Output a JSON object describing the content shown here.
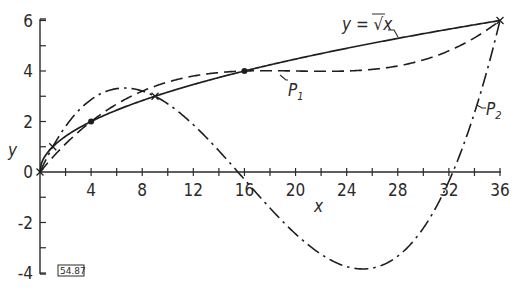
{
  "chart_data": {
    "type": "line",
    "title": "",
    "xlabel": "x",
    "ylabel": "y",
    "xlim": [
      0,
      36
    ],
    "ylim": [
      -4,
      6
    ],
    "grid": false,
    "legend_position": "inline labels on curves",
    "x_ticks": [
      0,
      2,
      4,
      6,
      8,
      10,
      12,
      14,
      16,
      18,
      20,
      22,
      24,
      26,
      28,
      30,
      32,
      34,
      36
    ],
    "x_tick_labels": [
      "4",
      "8",
      "12",
      "16",
      "20",
      "24",
      "28",
      "32",
      "36"
    ],
    "x_tick_label_values": [
      4,
      8,
      12,
      16,
      20,
      24,
      28,
      32,
      36
    ],
    "y_ticks": [
      -4,
      -3,
      -2,
      -1,
      0,
      1,
      2,
      3,
      4,
      5,
      6
    ],
    "y_tick_labels": [
      "-4",
      "-2",
      "0",
      "2",
      "4",
      "6"
    ],
    "y_tick_label_values": [
      -4,
      -2,
      0,
      2,
      4,
      6
    ],
    "series": [
      {
        "name": "y = ∛x",
        "label": "y = √x",
        "style": "solid",
        "function": "sqrt(x)",
        "x": [
          0,
          0.25,
          1,
          2,
          4,
          6,
          9,
          12,
          16,
          20,
          25,
          30,
          36
        ],
        "values": [
          0,
          0.5,
          1,
          1.41,
          2,
          2.45,
          3,
          3.46,
          4,
          4.47,
          5,
          5.48,
          6
        ]
      },
      {
        "name": "P1",
        "label": "P1",
        "style": "dashed",
        "interpolation_nodes_x": [
          0,
          4,
          16,
          36
        ],
        "interpolation_nodes_y": [
          0,
          2,
          4,
          6
        ],
        "x": [
          0,
          2,
          4,
          6,
          8,
          10,
          12,
          14,
          16,
          18,
          20,
          22,
          24,
          26,
          28,
          30,
          32,
          34,
          36
        ],
        "values": [
          0,
          1.16,
          2,
          2.58,
          3.0,
          3.31,
          3.55,
          3.78,
          4.0,
          4.23,
          4.43,
          4.62,
          4.8,
          4.98,
          5.17,
          5.38,
          5.62,
          5.87,
          6.0
        ]
      },
      {
        "name": "P2",
        "label": "P2",
        "style": "dash-dot",
        "interpolation_nodes_x": [
          0,
          1,
          9,
          36
        ],
        "interpolation_nodes_y": [
          0,
          1,
          3,
          6
        ],
        "x": [
          0,
          1,
          2,
          4,
          6,
          8,
          9,
          10,
          12,
          14,
          16,
          18,
          20,
          22,
          24,
          26,
          28,
          30,
          32,
          34,
          36
        ],
        "values": [
          0,
          1,
          1.82,
          2.92,
          3.24,
          3.09,
          3.0,
          2.58,
          1.82,
          0.94,
          0.0,
          -1.17,
          -2.27,
          -3.12,
          -3.71,
          -3.93,
          -3.7,
          -2.93,
          -1.52,
          1.55,
          6.0
        ]
      }
    ],
    "markers": {
      "dots": [
        [
          4,
          2
        ],
        [
          16,
          4
        ]
      ],
      "crosses": [
        [
          0,
          0
        ],
        [
          1,
          1
        ],
        [
          9,
          3
        ],
        [
          36,
          6
        ]
      ]
    },
    "annotations": [
      "y = √x",
      "P1",
      "P2",
      "54.87"
    ]
  },
  "labels": {
    "x_axis": "x",
    "y_axis": "y",
    "curve_sqrt": "y = √x",
    "curve_p1": "P",
    "curve_p1_sub": "1",
    "curve_p2": "P",
    "curve_p2_sub": "2",
    "ref_code": "54.87",
    "origin": "0"
  },
  "colors": {
    "ink": "#1e1e1e",
    "background": "#ffffff"
  }
}
